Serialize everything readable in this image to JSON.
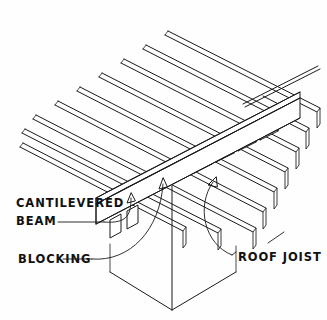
{
  "diagram": {
    "background_color": "#fefefe",
    "line_color": "#1a1a1a",
    "view": "isometric",
    "width": 327,
    "height": 320
  },
  "labels": {
    "cantilevered_beam_line1": "CANTILEVERED",
    "cantilevered_beam_line2": "BEAM",
    "blocking": "BLOCKING",
    "roof_joist": "ROOF JOIST"
  },
  "components": {
    "roof_joists": {
      "name": "ROOF JOIST",
      "count": 9,
      "description": "Parallel sloping members running upper-left to lower-right"
    },
    "blocking": {
      "name": "BLOCKING",
      "count": 8,
      "description": "Short panels set between joists over the beam line"
    },
    "cantilevered_beam": {
      "name": "CANTILEVERED BEAM",
      "count": 1,
      "description": "Deep beam running beneath and across the joists, projecting past the post"
    },
    "post": {
      "name": "POST",
      "count": 1,
      "description": "Vertical support column below the beam"
    }
  },
  "geometry": {
    "joist_dir": {
      "dx": 168,
      "dy": -86
    },
    "joist_offset": {
      "dx": 39,
      "dy": 25
    },
    "joist_depth": 17,
    "joist_thickness": 4,
    "joist_origins": [
      {
        "x": 64,
        "y": 330
      },
      {
        "x": 62,
        "y": 306
      },
      {
        "x": 60,
        "y": 282
      },
      {
        "x": 58,
        "y": 258
      },
      {
        "x": 56,
        "y": 234
      },
      {
        "x": 54,
        "y": 210
      },
      {
        "x": 52,
        "y": 186
      },
      {
        "x": 50,
        "y": 162
      },
      {
        "x": 48,
        "y": 138
      }
    ],
    "beam": {
      "start": {
        "x": 96,
        "y": 203
      },
      "end": {
        "x": 326,
        "y": 86
      },
      "depth": 22,
      "thickness": 7
    },
    "blocking_line": {
      "start": {
        "x": 120,
        "y": 193
      },
      "end": {
        "x": 318,
        "y": 92
      },
      "height": 15
    },
    "post": {
      "apex": {
        "x": 172,
        "y": 310
      },
      "left": {
        "x": 108,
        "y": 272
      },
      "right": {
        "x": 236,
        "y": 272
      },
      "top": {
        "x": 172,
        "y": 185
      }
    }
  },
  "leaders": {
    "cantilevered_beam": {
      "from": {
        "x": 116,
        "y": 222
      },
      "to": {
        "x": 131,
        "y": 196
      },
      "arrow": true
    },
    "blocking": {
      "from": {
        "x": 92,
        "y": 259
      },
      "to": {
        "x": 163,
        "y": 177
      },
      "arrow": true
    },
    "roof_joist": {
      "from": {
        "x": 238,
        "y": 257
      },
      "to": {
        "x": 213,
        "y": 174
      },
      "arrow": true
    }
  },
  "label_positions": {
    "cantilevered_beam_line1": {
      "x": 16,
      "y": 203
    },
    "cantilevered_beam_line2": {
      "x": 16,
      "y": 221
    },
    "blocking": {
      "x": 18,
      "y": 259
    },
    "roof_joist": {
      "x": 236,
      "y": 257
    }
  }
}
